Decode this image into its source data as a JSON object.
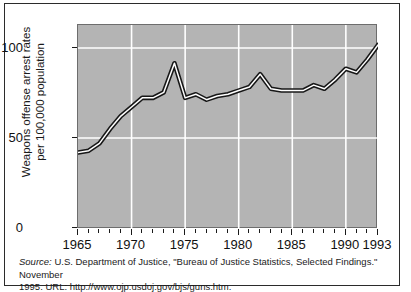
{
  "chart_data": {
    "type": "line",
    "title": "",
    "xlabel": "",
    "ylabel": "Weapons offense arrest rates\nper 100,000 population",
    "ylim": [
      0,
      112
    ],
    "xlim": [
      1965,
      1993
    ],
    "yticks": [
      0,
      50,
      100
    ],
    "ytick_labels": [
      "0",
      "50",
      "100"
    ],
    "xticks": [
      1965,
      1970,
      1975,
      1980,
      1985,
      1990,
      1993
    ],
    "xtick_labels": [
      "1965",
      "1970",
      "1975",
      "1980",
      "1985",
      "1990",
      "1993"
    ],
    "minor_xticks_every": 1,
    "grid": "white gridlines at y=50, y=100 and x=1970, 1975, 1980, 1985, 1990",
    "legend": "none",
    "plot_background": "#b4b4b4",
    "line_color": "#1a1a1a",
    "line_highlight_color": "#ffffff",
    "x": [
      1965,
      1966,
      1967,
      1968,
      1969,
      1970,
      1971,
      1972,
      1973,
      1974,
      1975,
      1976,
      1977,
      1978,
      1979,
      1980,
      1981,
      1982,
      1983,
      1984,
      1985,
      1986,
      1987,
      1988,
      1989,
      1990,
      1991,
      1992,
      1993
    ],
    "values": [
      42,
      43,
      47,
      55,
      62,
      67,
      72,
      72,
      75,
      91,
      72,
      74,
      71,
      73,
      74,
      76,
      78,
      85,
      77,
      76,
      76,
      76,
      79,
      77,
      82,
      88,
      86,
      93,
      101
    ]
  },
  "yaxis": {
    "title_line1": "Weapons offense arrest rates",
    "title_line2": "per 100,000 population"
  },
  "caption": {
    "source_label": "Source:",
    "line1_rest": " U.S. Department of Justice, \"Bureau of Justice Statistics, Selected Findings.\" November",
    "line2": "1995.  URL: http://www.ojp.usdoj.gov/bjs/guns.htm."
  }
}
